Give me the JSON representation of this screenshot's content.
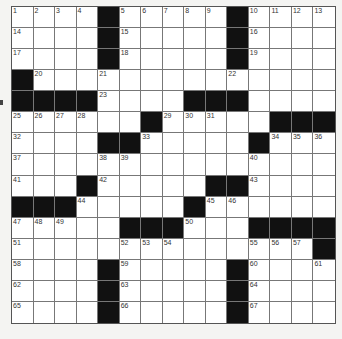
{
  "puzzle": {
    "rows": 15,
    "cols": 15,
    "colors": {
      "block": "#111111",
      "cell": "#ffffff",
      "line": "#777777",
      "page": "#f4f4f2"
    },
    "layout": [
      "....#.....#....",
      "....#.....#....",
      "....#.....#....",
      "#..............",
      "####....###....",
      "......#.....###",
      "....##.....#...",
      "...............",
      "...#.....##....",
      "###.....#......",
      ".....###...####",
      "..............#",
      "....#.....#....",
      "....#.....#....",
      "....#.....#...."
    ],
    "numbers": [
      {
        "r": 0,
        "c": 0,
        "n": "1"
      },
      {
        "r": 0,
        "c": 1,
        "n": "2"
      },
      {
        "r": 0,
        "c": 2,
        "n": "3"
      },
      {
        "r": 0,
        "c": 3,
        "n": "4"
      },
      {
        "r": 0,
        "c": 5,
        "n": "5"
      },
      {
        "r": 0,
        "c": 6,
        "n": "6"
      },
      {
        "r": 0,
        "c": 7,
        "n": "7"
      },
      {
        "r": 0,
        "c": 8,
        "n": "8"
      },
      {
        "r": 0,
        "c": 9,
        "n": "9"
      },
      {
        "r": 0,
        "c": 11,
        "n": "10"
      },
      {
        "r": 0,
        "c": 12,
        "n": "11"
      },
      {
        "r": 0,
        "c": 13,
        "n": "12"
      },
      {
        "r": 0,
        "c": 14,
        "n": "13"
      },
      {
        "r": 1,
        "c": 0,
        "n": "14"
      },
      {
        "r": 1,
        "c": 5,
        "n": "15"
      },
      {
        "r": 1,
        "c": 11,
        "n": "16"
      },
      {
        "r": 2,
        "c": 0,
        "n": "17"
      },
      {
        "r": 2,
        "c": 5,
        "n": "18"
      },
      {
        "r": 2,
        "c": 11,
        "n": "19"
      },
      {
        "r": 3,
        "c": 1,
        "n": "20"
      },
      {
        "r": 3,
        "c": 4,
        "n": "21"
      },
      {
        "r": 3,
        "c": 10,
        "n": "22"
      },
      {
        "r": 4,
        "c": 4,
        "n": "23"
      },
      {
        "r": 4,
        "c": 10,
        "n": "24"
      },
      {
        "r": 5,
        "c": 0,
        "n": "25"
      },
      {
        "r": 5,
        "c": 1,
        "n": "26"
      },
      {
        "r": 5,
        "c": 2,
        "n": "27"
      },
      {
        "r": 5,
        "c": 3,
        "n": "28"
      },
      {
        "r": 5,
        "c": 7,
        "n": "29"
      },
      {
        "r": 5,
        "c": 8,
        "n": "30"
      },
      {
        "r": 5,
        "c": 9,
        "n": "31"
      },
      {
        "r": 6,
        "c": 0,
        "n": "32"
      },
      {
        "r": 6,
        "c": 6,
        "n": "33"
      },
      {
        "r": 6,
        "c": 12,
        "n": "34"
      },
      {
        "r": 6,
        "c": 13,
        "n": "35"
      },
      {
        "r": 6,
        "c": 14,
        "n": "36"
      },
      {
        "r": 7,
        "c": 0,
        "n": "37"
      },
      {
        "r": 7,
        "c": 4,
        "n": "38"
      },
      {
        "r": 7,
        "c": 5,
        "n": "39"
      },
      {
        "r": 7,
        "c": 11,
        "n": "40"
      },
      {
        "r": 8,
        "c": 0,
        "n": "41"
      },
      {
        "r": 8,
        "c": 4,
        "n": "42"
      },
      {
        "r": 8,
        "c": 11,
        "n": "43"
      },
      {
        "r": 9,
        "c": 3,
        "n": "44"
      },
      {
        "r": 9,
        "c": 9,
        "n": "45"
      },
      {
        "r": 9,
        "c": 10,
        "n": "46"
      },
      {
        "r": 10,
        "c": 0,
        "n": "47"
      },
      {
        "r": 10,
        "c": 1,
        "n": "48"
      },
      {
        "r": 10,
        "c": 2,
        "n": "49"
      },
      {
        "r": 10,
        "c": 8,
        "n": "50"
      },
      {
        "r": 11,
        "c": 0,
        "n": "51"
      },
      {
        "r": 11,
        "c": 5,
        "n": "52"
      },
      {
        "r": 11,
        "c": 6,
        "n": "53"
      },
      {
        "r": 11,
        "c": 7,
        "n": "54"
      },
      {
        "r": 11,
        "c": 11,
        "n": "55"
      },
      {
        "r": 11,
        "c": 12,
        "n": "56"
      },
      {
        "r": 11,
        "c": 13,
        "n": "57"
      },
      {
        "r": 12,
        "c": 0,
        "n": "58"
      },
      {
        "r": 12,
        "c": 5,
        "n": "59"
      },
      {
        "r": 12,
        "c": 11,
        "n": "60"
      },
      {
        "r": 12,
        "c": 14,
        "n": "61"
      },
      {
        "r": 13,
        "c": 0,
        "n": "62"
      },
      {
        "r": 13,
        "c": 5,
        "n": "63"
      },
      {
        "r": 13,
        "c": 11,
        "n": "64"
      },
      {
        "r": 14,
        "c": 0,
        "n": "65"
      },
      {
        "r": 14,
        "c": 5,
        "n": "66"
      },
      {
        "r": 14,
        "c": 11,
        "n": "67"
      }
    ]
  }
}
